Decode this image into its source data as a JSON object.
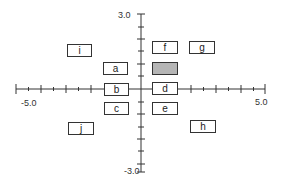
{
  "axes": {
    "x_min_label": "-5.0",
    "x_max_label": "5.0",
    "y_max_label": "3.0",
    "y_min_label": "-3.0"
  },
  "colors": {
    "line": "#333333",
    "box_border": "#333333",
    "shaded_fill": "#b5b5b5"
  },
  "boxes": [
    {
      "id": "i",
      "label": "i"
    },
    {
      "id": "a",
      "label": "a"
    },
    {
      "id": "b",
      "label": "b"
    },
    {
      "id": "c",
      "label": "c"
    },
    {
      "id": "f",
      "label": "f"
    },
    {
      "id": "g",
      "label": "g"
    },
    {
      "id": "shaded",
      "label": ""
    },
    {
      "id": "d",
      "label": "d"
    },
    {
      "id": "e",
      "label": "e"
    },
    {
      "id": "j",
      "label": "j"
    },
    {
      "id": "h",
      "label": "h"
    }
  ]
}
